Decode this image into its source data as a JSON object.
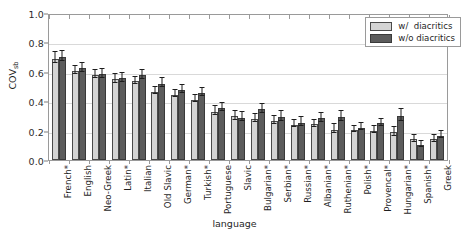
{
  "chart_data": {
    "type": "bar",
    "title": "",
    "xlabel": "language",
    "ylabel": "COV",
    "ylabel_sub": "sb",
    "ylim": [
      0.0,
      1.0
    ],
    "yticks": [
      "0.0",
      "0.2",
      "0.4",
      "0.6",
      "0.8",
      "1.0"
    ],
    "ytick_values": [
      0.0,
      0.2,
      0.4,
      0.6,
      0.8,
      1.0
    ],
    "grid": true,
    "legend_position": "upper right",
    "categories": [
      "French*",
      "English",
      "Neo-Greek",
      "Latin*",
      "Italian",
      "Old Slavic",
      "German*",
      "Turkish*",
      "Portuguese",
      "Slavic",
      "Bulgarian*",
      "Serbian*",
      "Russian*",
      "Albanian*",
      "Ruthenian*",
      "Polish*",
      "Provencal*",
      "Hungarian*",
      "Spanish*",
      "Greek"
    ],
    "series": [
      {
        "name": "w/  diacritics",
        "color": "#d4d4d4",
        "values": [
          0.69,
          0.605,
          0.578,
          0.548,
          0.535,
          0.465,
          0.445,
          0.41,
          0.33,
          0.298,
          0.28,
          0.265,
          0.24,
          0.243,
          0.205,
          0.205,
          0.2,
          0.188,
          0.14,
          0.14
        ],
        "errors": [
          0.035,
          0.03,
          0.028,
          0.028,
          0.025,
          0.022,
          0.025,
          0.025,
          0.028,
          0.03,
          0.025,
          0.03,
          0.025,
          0.025,
          0.03,
          0.022,
          0.025,
          0.03,
          0.022,
          0.025
        ]
      },
      {
        "name": "w/o diacritics",
        "color": "#5c5c5c",
        "values": [
          0.7,
          0.625,
          0.582,
          0.555,
          0.575,
          0.52,
          0.475,
          0.455,
          0.352,
          0.288,
          0.345,
          0.292,
          0.255,
          0.285,
          0.292,
          0.22,
          0.25,
          0.302,
          0.105,
          0.165
        ],
        "errors": [
          0.035,
          0.03,
          0.028,
          0.028,
          0.028,
          0.03,
          0.028,
          0.025,
          0.028,
          0.03,
          0.032,
          0.032,
          0.028,
          0.03,
          0.032,
          0.025,
          0.025,
          0.04,
          0.02,
          0.025
        ]
      }
    ]
  }
}
